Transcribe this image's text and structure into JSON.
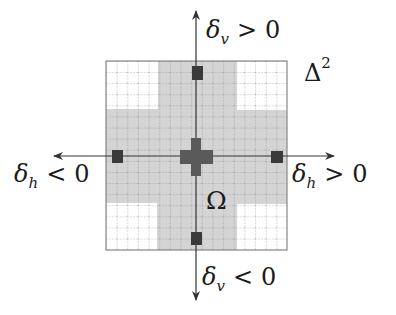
{
  "diagram": {
    "title": "",
    "domain_label": {
      "base": "Δ",
      "superscript": "2"
    },
    "region_label": "Ω",
    "axes": {
      "top": {
        "symbol": "δ",
        "subscript": "v",
        "relation": ">",
        "value": "0"
      },
      "bottom": {
        "symbol": "δ",
        "subscript": "v",
        "relation": "<",
        "value": "0"
      },
      "left": {
        "symbol": "δ",
        "subscript": "h",
        "relation": "<",
        "value": "0"
      },
      "right": {
        "symbol": "δ",
        "subscript": "h",
        "relation": ">",
        "value": "0"
      }
    },
    "grid": {
      "x": 106,
      "y": 61,
      "width": 181,
      "height": 189,
      "cells_x": 17,
      "cells_y": 17
    },
    "region_shape": "plus-shaped (cross) gray region Ω with white corners",
    "white_corners": [
      {
        "name": "top-left",
        "x": 106,
        "y": 61,
        "w": 52,
        "h": 48
      },
      {
        "name": "top-right",
        "x": 237,
        "y": 61,
        "w": 50,
        "h": 49
      },
      {
        "name": "bottom-left",
        "x": 106,
        "y": 203,
        "w": 51,
        "h": 47
      },
      {
        "name": "bottom-right",
        "x": 237,
        "y": 204,
        "w": 50,
        "h": 46
      }
    ],
    "markers": [
      {
        "name": "top",
        "x": 192,
        "y": 66,
        "w": 11,
        "h": 14
      },
      {
        "name": "left",
        "x": 112,
        "y": 150,
        "w": 11,
        "h": 13
      },
      {
        "name": "right",
        "x": 271,
        "y": 151,
        "w": 12,
        "h": 12
      },
      {
        "name": "bottom",
        "x": 191,
        "y": 232,
        "w": 11,
        "h": 13
      }
    ],
    "center_cross": {
      "vertical": {
        "x": 191,
        "y": 138,
        "w": 10,
        "h": 38
      },
      "horizontal": {
        "x": 180,
        "y": 150,
        "w": 33,
        "h": 14
      }
    },
    "colors": {
      "background": "#ffffff",
      "grid_fill_gray": "#d4d4d4",
      "grid_line": "#8a8a8a",
      "marker": "#3a3a3a",
      "center": "#5a5a5a",
      "axis": "#333333",
      "border": "#888888"
    }
  }
}
